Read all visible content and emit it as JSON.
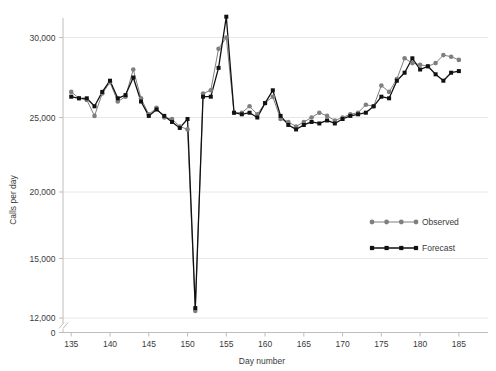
{
  "chart_data": {
    "type": "line",
    "title": "",
    "xlabel": "Day number",
    "ylabel": "Calls per day",
    "xlim": [
      134,
      186.5
    ],
    "ylim": [
      11800,
      31800
    ],
    "y_axis_break": true,
    "y_break_values": [
      0,
      12000
    ],
    "yticks": [
      0,
      12000,
      15000,
      20000,
      25000,
      30000
    ],
    "ytick_labels": [
      "0",
      "12,000",
      "15,000",
      "20,000",
      "25,000",
      "30,000"
    ],
    "xticks": [
      135,
      140,
      145,
      150,
      155,
      160,
      165,
      170,
      175,
      180,
      185
    ],
    "xtick_labels": [
      "135",
      "140",
      "145",
      "150",
      "155",
      "160",
      "165",
      "170",
      "175",
      "180",
      "185"
    ],
    "grid": true,
    "grid_axis": "y",
    "legend_position": "right-middle",
    "x": [
      135,
      136,
      137,
      138,
      139,
      140,
      141,
      142,
      143,
      144,
      145,
      146,
      147,
      148,
      149,
      150,
      151,
      152,
      153,
      154,
      155,
      156,
      157,
      158,
      159,
      160,
      161,
      162,
      163,
      164,
      165,
      166,
      167,
      168,
      169,
      170,
      171,
      172,
      173,
      174,
      175,
      176,
      177,
      178,
      179,
      180,
      181,
      182,
      183,
      184,
      185
    ],
    "series": [
      {
        "name": "Observed",
        "color": "#7f7f7f",
        "marker": "circle",
        "values": [
          26600,
          26200,
          26100,
          25100,
          26500,
          27200,
          26000,
          26300,
          28000,
          26200,
          25200,
          25600,
          25000,
          24900,
          24400,
          24200,
          12350,
          26500,
          26700,
          29300,
          30000,
          25300,
          25300,
          25700,
          25200,
          25900,
          26300,
          24900,
          24700,
          24400,
          24700,
          25000,
          25300,
          25100,
          24800,
          25000,
          25200,
          25300,
          25800,
          25700,
          27000,
          26600,
          27400,
          28700,
          28400,
          28300,
          28200,
          28400,
          28900,
          28800,
          28600
        ]
      },
      {
        "name": "Forecast",
        "color": "#111111",
        "marker": "square",
        "values": [
          26300,
          26200,
          26200,
          25700,
          26600,
          27300,
          26200,
          26400,
          27500,
          26000,
          25100,
          25500,
          25100,
          24700,
          24300,
          24900,
          12500,
          26300,
          26300,
          28100,
          31300,
          25300,
          25200,
          25300,
          25000,
          25900,
          26700,
          25100,
          24500,
          24200,
          24500,
          24700,
          24600,
          24800,
          24600,
          24900,
          25100,
          25200,
          25300,
          25700,
          26300,
          26200,
          27300,
          27800,
          28700,
          28000,
          28200,
          27700,
          27300,
          27800,
          27900
        ]
      }
    ]
  },
  "legend": {
    "items": [
      {
        "label": "Observed",
        "color": "#7f7f7f",
        "marker": "circle"
      },
      {
        "label": "Forecast",
        "color": "#111111",
        "marker": "square"
      }
    ]
  }
}
